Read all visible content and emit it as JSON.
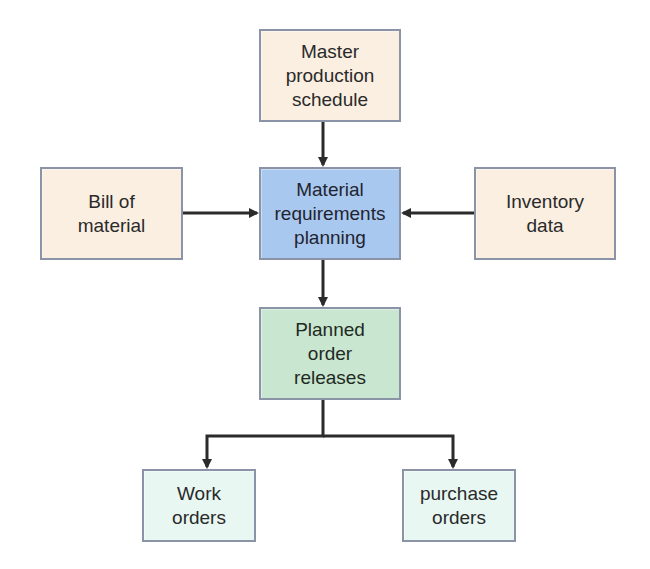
{
  "diagram": {
    "nodes": {
      "mps": {
        "label": "Master\nproduction\nschedule",
        "color": "#fbefe2"
      },
      "bom": {
        "label": "Bill of\nmaterial",
        "color": "#fbefe2"
      },
      "mrp": {
        "label": "Material\nrequirements\nplanning",
        "color": "#a9c8ef"
      },
      "inventory": {
        "label": "Inventory\ndata",
        "color": "#fbefe2"
      },
      "planned": {
        "label": "Planned\norder\nreleases",
        "color": "#c9e6d0"
      },
      "work": {
        "label": "Work\norders",
        "color": "#e8f7f2"
      },
      "purchase": {
        "label": "purchase\norders",
        "color": "#e8f7f2"
      }
    },
    "edges": [
      {
        "from": "Master production schedule",
        "to": "Material requirements planning"
      },
      {
        "from": "Bill of material",
        "to": "Material requirements planning"
      },
      {
        "from": "Inventory data",
        "to": "Material requirements planning"
      },
      {
        "from": "Material requirements planning",
        "to": "Planned order releases"
      },
      {
        "from": "Planned order releases",
        "to": "Work orders"
      },
      {
        "from": "Planned order releases",
        "to": "purchase orders"
      }
    ],
    "colors": {
      "border": "#8a94a6",
      "arrow": "#2b2b2b"
    }
  }
}
